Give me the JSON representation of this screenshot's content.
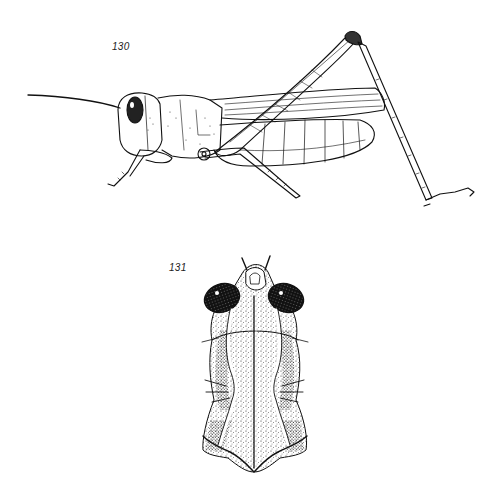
{
  "plate": {
    "background": "#ffffff",
    "ink": "#111111"
  },
  "figures": [
    {
      "number": "130",
      "subject": "grasshopper-lateral-view",
      "style": "line-drawing"
    },
    {
      "number": "131",
      "subject": "head-and-pronotum-dorsal-view",
      "style": "stipple-drawing"
    }
  ]
}
